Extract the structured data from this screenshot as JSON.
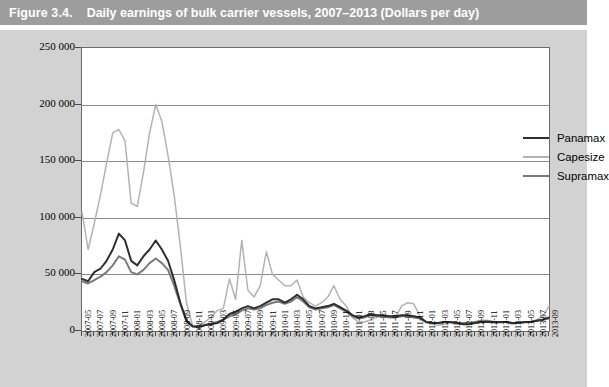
{
  "figure": {
    "number": "Figure 3.4.",
    "caption": "Daily earnings of bulk carrier vessels, 2007–2013 (Dollars per day)"
  },
  "legend": {
    "position": "inside-top-right",
    "entries": [
      {
        "label": "Panamax",
        "color": "#2e2e2e"
      },
      {
        "label": "Capesize",
        "color": "#b3b3b3"
      },
      {
        "label": "Supramax",
        "color": "#7a7a7a"
      }
    ]
  },
  "axes": {
    "y_ticks": [
      "0",
      "50 000",
      "100 000",
      "150 000",
      "200 000",
      "250 000"
    ],
    "y_values": [
      0,
      50000,
      100000,
      150000,
      200000,
      250000
    ],
    "x_labels": [
      "2007-05",
      "2007-07",
      "2007-09",
      "2007-11",
      "2008-01",
      "2008-03",
      "2008-05",
      "2008-07",
      "2008-09",
      "2008-11",
      "2009-01",
      "2009-03",
      "2009-05",
      "2009-07",
      "2009-09",
      "2009-11",
      "2010-01",
      "2010-03",
      "2010-05",
      "2010-07",
      "2010-09",
      "2010-11",
      "2011-01",
      "2011-03",
      "2011-05",
      "2011-07",
      "2011-09",
      "2011-11",
      "2012-01",
      "2012-03",
      "2012-05",
      "2012-07",
      "2012-09",
      "2012-11",
      "2013-01",
      "2013-03",
      "2013-05",
      "2013-07",
      "2013-09"
    ]
  },
  "chart_data": {
    "type": "line",
    "title": "Daily earnings of bulk carrier vessels, 2007–2013 (Dollars per day)",
    "xlabel": "",
    "ylabel": "Dollars per day",
    "ylim": [
      0,
      250000
    ],
    "grid": true,
    "legend_position": "inside-top-right",
    "x": [
      "2007-05",
      "2007-06",
      "2007-07",
      "2007-08",
      "2007-09",
      "2007-10",
      "2007-11",
      "2007-12",
      "2008-01",
      "2008-02",
      "2008-03",
      "2008-04",
      "2008-05",
      "2008-06",
      "2008-07",
      "2008-08",
      "2008-09",
      "2008-10",
      "2008-11",
      "2008-12",
      "2009-01",
      "2009-02",
      "2009-03",
      "2009-04",
      "2009-05",
      "2009-06",
      "2009-07",
      "2009-08",
      "2009-09",
      "2009-10",
      "2009-11",
      "2009-12",
      "2010-01",
      "2010-02",
      "2010-03",
      "2010-04",
      "2010-05",
      "2010-06",
      "2010-07",
      "2010-08",
      "2010-09",
      "2010-10",
      "2010-11",
      "2010-12",
      "2011-01",
      "2011-02",
      "2011-03",
      "2011-04",
      "2011-05",
      "2011-06",
      "2011-07",
      "2011-08",
      "2011-09",
      "2011-10",
      "2011-11",
      "2011-12",
      "2012-01",
      "2012-02",
      "2012-03",
      "2012-04",
      "2012-05",
      "2012-06",
      "2012-07",
      "2012-08",
      "2012-09",
      "2012-10",
      "2012-11",
      "2012-12",
      "2013-01",
      "2013-02",
      "2013-03",
      "2013-04",
      "2013-05",
      "2013-06",
      "2013-07",
      "2013-08",
      "2013-09"
    ],
    "series": [
      {
        "name": "Capesize",
        "color": "#b3b3b3",
        "values": [
          105000,
          72000,
          95000,
          120000,
          148000,
          175000,
          178000,
          168000,
          113000,
          110000,
          140000,
          175000,
          200000,
          185000,
          155000,
          120000,
          75000,
          25000,
          5000,
          4000,
          8000,
          12000,
          18000,
          20000,
          46000,
          28000,
          80000,
          36000,
          30000,
          40000,
          70000,
          50000,
          45000,
          40000,
          40000,
          45000,
          30000,
          25000,
          22000,
          25000,
          30000,
          40000,
          28000,
          22000,
          12000,
          8000,
          8000,
          10000,
          12000,
          14000,
          13000,
          12000,
          22000,
          25000,
          24000,
          13000,
          8000,
          6000,
          5000,
          6000,
          7000,
          6000,
          6000,
          6000,
          8000,
          9000,
          8000,
          7000,
          7000,
          8000,
          6000,
          7000,
          7000,
          8000,
          10000,
          13000,
          22000
        ]
      },
      {
        "name": "Panamax",
        "color": "#2e2e2e",
        "values": [
          46000,
          44000,
          52000,
          55000,
          62000,
          72000,
          86000,
          80000,
          62000,
          58000,
          66000,
          72000,
          80000,
          72000,
          62000,
          45000,
          25000,
          9000,
          4000,
          3500,
          5000,
          6000,
          7000,
          10000,
          15000,
          17000,
          20000,
          22000,
          20000,
          22000,
          25000,
          28000,
          28000,
          25000,
          28000,
          32000,
          28000,
          22000,
          20000,
          21000,
          22000,
          24000,
          21000,
          18000,
          14000,
          12000,
          13000,
          15000,
          14000,
          14000,
          13000,
          13000,
          14000,
          14000,
          13000,
          12000,
          8000,
          7000,
          7000,
          8000,
          8000,
          7000,
          6000,
          6000,
          7000,
          8000,
          8000,
          8000,
          8000,
          8000,
          7000,
          7000,
          8000,
          8000,
          9000,
          10000,
          12000
        ]
      },
      {
        "name": "Supramax",
        "color": "#7a7a7a",
        "values": [
          44000,
          42000,
          45000,
          48000,
          52000,
          58000,
          66000,
          63000,
          52000,
          50000,
          54000,
          60000,
          64000,
          60000,
          54000,
          40000,
          24000,
          9000,
          4500,
          4000,
          5500,
          6500,
          8000,
          10000,
          13000,
          15000,
          18000,
          20000,
          19000,
          20000,
          23000,
          25000,
          26000,
          24000,
          26000,
          30000,
          26000,
          21000,
          19000,
          20000,
          21000,
          23000,
          20000,
          17000,
          13000,
          11000,
          12000,
          14000,
          13000,
          13000,
          12000,
          12000,
          13000,
          13000,
          12000,
          11000,
          8000,
          7000,
          7000,
          8000,
          8000,
          7000,
          7000,
          7000,
          8000,
          9000,
          9000,
          8000,
          8000,
          8000,
          7000,
          7000,
          8000,
          8000,
          9000,
          10000,
          11000
        ]
      }
    ]
  }
}
